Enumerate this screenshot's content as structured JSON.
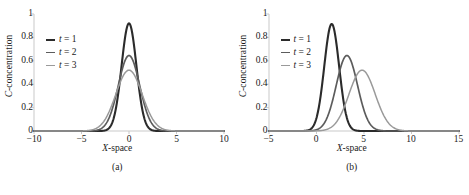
{
  "figure": {
    "background": "#ffffff",
    "axis_color": "#c9c9c9",
    "text_color": "#1a1a1a"
  },
  "chart_data": [
    {
      "type": "line",
      "panel_label": "(a)",
      "title": "",
      "xlabel": "X-space",
      "ylabel": "C-concentration",
      "xlim": [
        -10,
        10
      ],
      "ylim": [
        0,
        1
      ],
      "xticks": [
        -10,
        -5,
        0,
        5,
        10
      ],
      "xtick_labels": [
        "−10",
        "−5",
        "0",
        "5",
        "10"
      ],
      "yticks": [
        0,
        0.2,
        0.4,
        0.6,
        0.8,
        1
      ],
      "ytick_labels": [
        "0",
        "0.2",
        "0.4",
        "0.6",
        "0.8",
        "1"
      ],
      "grid": false,
      "legend_position": "upper-left-inside",
      "series": [
        {
          "name": "t = 1",
          "legend_label": "t = 1",
          "color": "#2b2b2b",
          "line_width": 2.1,
          "peak_x": 0,
          "peak_y": 0.92,
          "sigma": 0.78
        },
        {
          "name": "t = 2",
          "legend_label": "t = 2",
          "color": "#5c5c5c",
          "line_width": 1.7,
          "peak_x": 0,
          "peak_y": 0.645,
          "sigma": 1.12
        },
        {
          "name": "t = 3",
          "legend_label": "t = 3",
          "color": "#9a9a9a",
          "line_width": 1.5,
          "peak_x": 0,
          "peak_y": 0.52,
          "sigma": 1.38
        }
      ]
    },
    {
      "type": "line",
      "panel_label": "(b)",
      "title": "",
      "xlabel": "X-space",
      "ylabel": "C-concentration",
      "xlim": [
        -5,
        15
      ],
      "ylim": [
        0,
        1
      ],
      "xticks": [
        -5,
        0,
        5,
        10,
        15
      ],
      "xtick_labels": [
        "−5",
        "0",
        "5",
        "10",
        "15"
      ],
      "yticks": [
        0,
        0.2,
        0.4,
        0.6,
        0.8,
        1
      ],
      "ytick_labels": [
        "0",
        "0.2",
        "0.4",
        "0.6",
        "0.8",
        "1"
      ],
      "grid": false,
      "legend_position": "upper-left-inside",
      "series": [
        {
          "name": "t = 1",
          "legend_label": "t = 1",
          "color": "#2b2b2b",
          "line_width": 2.1,
          "peak_x": 1.6,
          "peak_y": 0.915,
          "sigma": 0.78
        },
        {
          "name": "t = 2",
          "legend_label": "t = 2",
          "color": "#5c5c5c",
          "line_width": 1.7,
          "peak_x": 3.2,
          "peak_y": 0.645,
          "sigma": 1.12
        },
        {
          "name": "t = 3",
          "legend_label": "t = 3",
          "color": "#9a9a9a",
          "line_width": 1.5,
          "peak_x": 4.8,
          "peak_y": 0.52,
          "sigma": 1.38
        }
      ]
    }
  ]
}
